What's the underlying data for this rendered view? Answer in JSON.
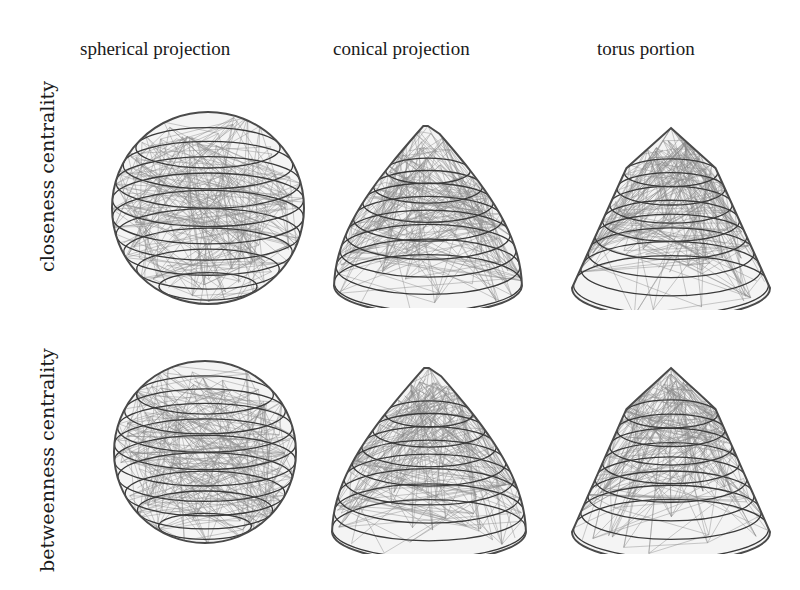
{
  "figure": {
    "columns": [
      {
        "label": "spherical projection"
      },
      {
        "label": "conical projection"
      },
      {
        "label": "torus portion"
      }
    ],
    "rows": [
      {
        "label": "closeness centrality"
      },
      {
        "label": "betweenness centrality"
      }
    ],
    "panels": [
      {
        "row": "closeness centrality",
        "column": "spherical projection",
        "shape": "sphere"
      },
      {
        "row": "closeness centrality",
        "column": "conical projection",
        "shape": "cone"
      },
      {
        "row": "closeness centrality",
        "column": "torus portion",
        "shape": "torus-cone"
      },
      {
        "row": "betweenness centrality",
        "column": "spherical projection",
        "shape": "sphere"
      },
      {
        "row": "betweenness centrality",
        "column": "conical projection",
        "shape": "cone"
      },
      {
        "row": "betweenness centrality",
        "column": "torus portion",
        "shape": "torus-cone"
      }
    ],
    "colors": {
      "edges": "#8a8a8a",
      "rings": "#3a3a3a",
      "text": "#1a1a1a",
      "background": "#ffffff"
    }
  }
}
